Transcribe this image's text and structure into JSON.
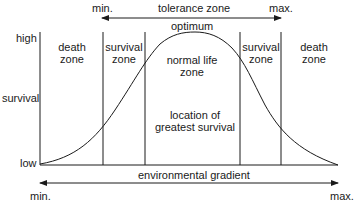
{
  "diagram": {
    "tolerance_arrow": {
      "label": "tolerance zone",
      "min": "min.",
      "max": "max."
    },
    "gradient_arrow": {
      "label": "environmental gradient",
      "min": "min.",
      "max": "max."
    },
    "y_axis": {
      "label": "survival",
      "high": "high",
      "low": "low"
    },
    "peak_label": "optimum",
    "zones": [
      {
        "label": "death zone"
      },
      {
        "label": "survival zone"
      },
      {
        "label": "normal life zone"
      },
      {
        "label": "survival zone"
      },
      {
        "label": "death zone"
      }
    ],
    "center_note": "location of greatest survival",
    "line_color": "#1a1a1a"
  }
}
